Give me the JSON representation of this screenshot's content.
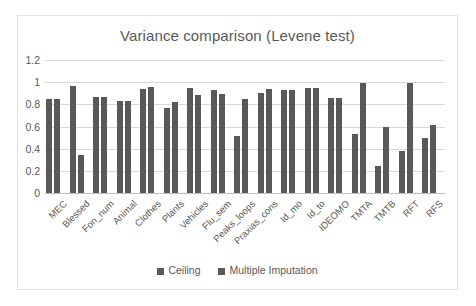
{
  "chart_data": {
    "type": "bar",
    "title": "Variance comparison (Levene test)",
    "xlabel": "",
    "ylabel": "",
    "ylim": [
      0,
      1.2
    ],
    "yticks": [
      "0",
      "0.2",
      "0.4",
      "0.6",
      "0.8",
      "1",
      "1.2"
    ],
    "ytick_values": [
      0,
      0.2,
      0.4,
      0.6,
      0.8,
      1,
      1.2
    ],
    "grid": true,
    "legend_position": "bottom",
    "categories": [
      "MEC",
      "Blessed",
      "Fon_num",
      "Animal",
      "Clothes",
      "Plants",
      "Vehicles",
      "Flu_sem",
      "Peaks_loops",
      "Praxias_cons",
      "Id_mo",
      "Id_to",
      "IDEOMO",
      "TMTA",
      "TMTB",
      "RFT",
      "RFS"
    ],
    "series": [
      {
        "name": "Ceiling",
        "color": "#595959",
        "values": [
          0.85,
          0.97,
          0.87,
          0.83,
          0.94,
          0.77,
          0.95,
          0.93,
          0.51,
          0.9,
          0.93,
          0.95,
          0.86,
          0.53,
          0.24,
          0.38,
          0.5
        ]
      },
      {
        "name": "Multiple Imputation",
        "color": "#595959",
        "values": [
          0.85,
          0.34,
          0.87,
          0.83,
          0.96,
          0.82,
          0.88,
          0.89,
          0.85,
          0.94,
          0.93,
          0.95,
          0.86,
          0.99,
          0.6,
          0.99,
          0.61
        ]
      }
    ]
  },
  "colors": {
    "bar": "#595959",
    "gridline": "#d9d9d9",
    "text": "#595959",
    "frame_border": "#e2e2e2",
    "background": "#ffffff"
  }
}
